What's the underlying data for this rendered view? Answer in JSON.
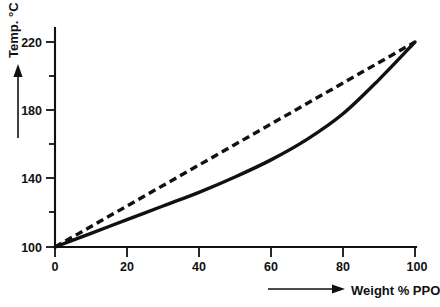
{
  "chart_data": {
    "type": "line",
    "title": "",
    "subtitle": "",
    "xlabel": "Weight % PPO",
    "ylabel": "Temp. °C",
    "xlim": [
      0,
      100
    ],
    "ylim": [
      100,
      228
    ],
    "grid": false,
    "legend_position": "none",
    "x_ticks": [
      0,
      20,
      40,
      60,
      80,
      100
    ],
    "x_tick_labels": [
      "0",
      "20",
      "40",
      "60",
      "80",
      "100"
    ],
    "x_minor_ticks": [
      10,
      30,
      50,
      70,
      90
    ],
    "y_ticks": [
      100,
      140,
      180,
      220
    ],
    "y_tick_labels": [
      "100",
      "140",
      "180",
      "220"
    ],
    "y_minor_ticks": [
      120,
      160,
      200
    ],
    "x": [
      0,
      10,
      20,
      30,
      40,
      50,
      60,
      70,
      80,
      90,
      100
    ],
    "series": [
      {
        "name": "linear-additivity-line",
        "style": "dashed",
        "color": "#111111",
        "values": [
          100,
          112,
          124,
          136,
          148,
          160,
          172,
          184,
          196,
          208,
          220
        ]
      },
      {
        "name": "measured-glass-transition-curve",
        "style": "solid",
        "color": "#111111",
        "values": [
          100,
          108,
          116,
          124,
          132,
          141,
          151,
          163,
          178,
          198,
          220
        ]
      }
    ],
    "annotations": []
  },
  "axes": {
    "y": {
      "label": "Temp. °C",
      "arrow_direction": "up",
      "arrow_name": "y-axis-direction-arrow"
    },
    "x": {
      "label": "Weight % PPO",
      "arrow_direction": "right",
      "arrow_name": "x-axis-direction-arrow"
    }
  }
}
